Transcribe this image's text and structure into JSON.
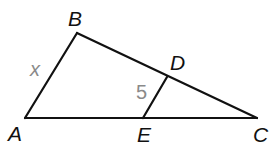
{
  "diagram": {
    "type": "triangle-with-parallel-segment",
    "colors": {
      "line": "#111111",
      "measure": "#8a8a8a",
      "background": "#ffffff"
    },
    "vertices": {
      "A": {
        "label": "A",
        "x": 25,
        "y": 118
      },
      "B": {
        "label": "B",
        "x": 77,
        "y": 33
      },
      "C": {
        "label": "C",
        "x": 257,
        "y": 118
      },
      "D": {
        "label": "D",
        "x": 167,
        "y": 77
      },
      "E": {
        "label": "E",
        "x": 143,
        "y": 118
      }
    },
    "segments": [
      {
        "from": "A",
        "to": "B"
      },
      {
        "from": "B",
        "to": "C"
      },
      {
        "from": "A",
        "to": "C"
      },
      {
        "from": "E",
        "to": "D"
      }
    ],
    "measures": {
      "AB": "x",
      "ED": "5"
    }
  }
}
